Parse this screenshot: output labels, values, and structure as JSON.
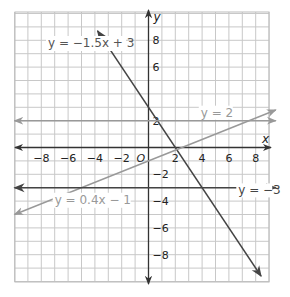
{
  "chart_data": {
    "type": "line",
    "title": "",
    "xlabel": "x",
    "ylabel": "y",
    "origin_label": "O",
    "xlim": [
      -10,
      9.5
    ],
    "ylim": [
      -10,
      10
    ],
    "grid": true,
    "x_ticks": [
      -8,
      -6,
      -4,
      -2,
      2,
      4,
      6,
      8
    ],
    "y_ticks": [
      8,
      6,
      2,
      -2,
      -4,
      -6,
      -8
    ],
    "x_tick_labels": [
      "−8",
      "−6",
      "−4",
      "−2",
      "2",
      "4",
      "6",
      "8"
    ],
    "y_tick_labels": [
      "8",
      "6",
      "2",
      "−2",
      "−4",
      "−6",
      "−8"
    ],
    "series": [
      {
        "name": "y = −1.5x + 3",
        "slope": -1.5,
        "intercept": 3,
        "color": "#444444",
        "x_range": [
          -4.5,
          9
        ]
      },
      {
        "name": "y = 2",
        "slope": 0,
        "intercept": 2,
        "color": "#999999",
        "x_range": [
          -10,
          9.5
        ]
      },
      {
        "name": "y = 0.4x − 1",
        "slope": 0.4,
        "intercept": -1,
        "color": "#999999",
        "x_range": [
          -10,
          9.5
        ]
      },
      {
        "name": "y = −3",
        "slope": 0,
        "intercept": -3,
        "color": "#444444",
        "x_range": [
          -10,
          9.5
        ]
      }
    ],
    "annotations": [
      {
        "text": "y = −1.5x + 3",
        "x": -7.5,
        "y": 7.5
      },
      {
        "text": "y = 2",
        "x": 3.9,
        "y": 2.3
      },
      {
        "text": "y = 0.4x − 1",
        "x": -7,
        "y": -4.2
      },
      {
        "text": "y = −3",
        "x": 6.7,
        "y": -3.5
      }
    ]
  }
}
